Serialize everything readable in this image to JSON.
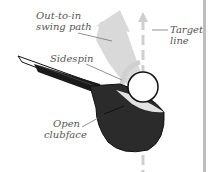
{
  "diagram": {
    "labels": {
      "swing_path_line1": "Out-to-in",
      "swing_path_line2": "swing path",
      "target_line1": "Target",
      "target_line2": "line",
      "sidespin": "Sidespin",
      "clubface_line1": "Open",
      "clubface_line2": "clubface"
    },
    "colors": {
      "clubhead": "#2b2b2b",
      "shaft": "#1a1a1a",
      "arrow_fill": "#d9d9d9",
      "target_line": "#cfcfcf",
      "leader_lines": "#777777",
      "ball_fill": "#ffffff",
      "ball_stroke": "#111111",
      "frame_rule": "#bdbdbd"
    }
  }
}
